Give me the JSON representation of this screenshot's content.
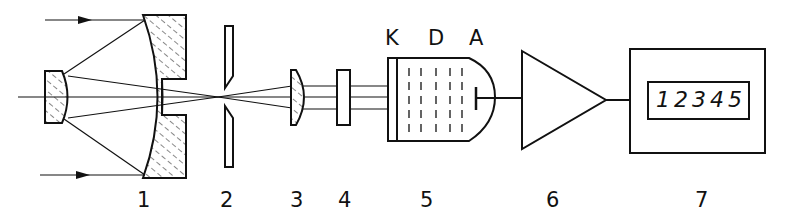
{
  "diagram": {
    "type": "optical measurement setup schematic",
    "colors": {
      "line": "#111111",
      "background": "#ffffff"
    },
    "components": [
      {
        "id": "1",
        "label": "1",
        "name": "Cassegrain mirror objective (primary concave mirror with central hole and secondary convex mirror)"
      },
      {
        "id": "2",
        "label": "2",
        "name": "Field stop / slit aperture"
      },
      {
        "id": "3",
        "label": "3",
        "name": "Collimating lens"
      },
      {
        "id": "4",
        "label": "4",
        "name": "Filter"
      },
      {
        "id": "5",
        "label": "5",
        "name": "Photomultiplier tube"
      },
      {
        "id": "6",
        "label": "6",
        "name": "Amplifier"
      },
      {
        "id": "7",
        "label": "7",
        "name": "Counter / digital display"
      }
    ],
    "pmt_electrodes": {
      "cathode": "K",
      "dynodes": "D",
      "anode": "A"
    },
    "display_value": "12345"
  }
}
